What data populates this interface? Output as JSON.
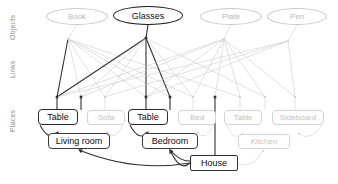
{
  "diagram": {
    "tiers": [
      {
        "id": "objects",
        "label": "Objects"
      },
      {
        "id": "links",
        "label": "Links"
      },
      {
        "id": "places",
        "label": "Places"
      }
    ],
    "objects": [
      {
        "id": "book",
        "label": "Book",
        "x": 46,
        "y": 8,
        "w": 62,
        "emphasis": "faded"
      },
      {
        "id": "glasses",
        "label": "Glasses",
        "x": 113,
        "y": 6,
        "w": 70,
        "emphasis": "strong"
      },
      {
        "id": "plate",
        "label": "Plate",
        "x": 200,
        "y": 8,
        "w": 62,
        "emphasis": "faded"
      },
      {
        "id": "pen",
        "label": "Pen",
        "x": 267,
        "y": 8,
        "w": 60,
        "emphasis": "faded"
      }
    ],
    "places": [
      {
        "id": "table-living",
        "label": "Table",
        "x": 38,
        "y": 109,
        "w": 40,
        "emphasis": "strong"
      },
      {
        "id": "sofa",
        "label": "Sofa",
        "x": 87,
        "y": 110,
        "w": 38,
        "emphasis": "faded"
      },
      {
        "id": "table-bedroom",
        "label": "Table",
        "x": 128,
        "y": 109,
        "w": 40,
        "emphasis": "strong"
      },
      {
        "id": "bed",
        "label": "Bed",
        "x": 178,
        "y": 110,
        "w": 38,
        "emphasis": "faded"
      },
      {
        "id": "table-kitchen",
        "label": "Table",
        "x": 224,
        "y": 110,
        "w": 38,
        "emphasis": "faded"
      },
      {
        "id": "sideboard",
        "label": "Sideboard",
        "x": 272,
        "y": 110,
        "w": 52,
        "emphasis": "faded"
      }
    ],
    "rooms": [
      {
        "id": "living-room",
        "label": "Living room",
        "x": 48,
        "y": 133,
        "w": 62,
        "emphasis": "strong"
      },
      {
        "id": "bedroom",
        "label": "Bedroom",
        "x": 142,
        "y": 133,
        "w": 56,
        "emphasis": "strong"
      },
      {
        "id": "kitchen",
        "label": "Kitchen",
        "x": 238,
        "y": 134,
        "w": 52,
        "emphasis": "faded"
      }
    ],
    "root": {
      "id": "house",
      "label": "House",
      "x": 190,
      "y": 155,
      "w": 48,
      "emphasis": "strong"
    },
    "link_hubs": [
      {
        "id": "hub-book",
        "x": 68,
        "y": 39,
        "emphasis": "faded"
      },
      {
        "id": "hub-glasses",
        "x": 146,
        "y": 38,
        "emphasis": "strong"
      },
      {
        "id": "hub-plate",
        "x": 224,
        "y": 39,
        "emphasis": "faded"
      },
      {
        "id": "hub-pen",
        "x": 288,
        "y": 41,
        "emphasis": "faded"
      }
    ],
    "place_anchors": [
      {
        "id": "anchor-table-living",
        "x": 57,
        "y": 97,
        "emphasis": "strong"
      },
      {
        "id": "anchor-sofa",
        "x": 81,
        "y": 97,
        "emphasis": "strong"
      },
      {
        "id": "anchor-sofa-2",
        "x": 105,
        "y": 97,
        "emphasis": "faded"
      },
      {
        "id": "anchor-table-bedroom",
        "x": 146,
        "y": 97,
        "emphasis": "strong"
      },
      {
        "id": "anchor-bed",
        "x": 170,
        "y": 97,
        "emphasis": "strong"
      },
      {
        "id": "anchor-bed-2",
        "x": 193,
        "y": 97,
        "emphasis": "faded"
      },
      {
        "id": "anchor-house-stem",
        "x": 215,
        "y": 97,
        "emphasis": "strong"
      },
      {
        "id": "anchor-table-kitchen",
        "x": 240,
        "y": 97,
        "emphasis": "faded"
      },
      {
        "id": "anchor-sideboard",
        "x": 265,
        "y": 97,
        "emphasis": "faded"
      },
      {
        "id": "anchor-sideboard-2",
        "x": 295,
        "y": 97,
        "emphasis": "faded"
      }
    ],
    "edges": {
      "object_to_hub": [
        {
          "from": "book",
          "to": "hub-book",
          "emphasis": "faded"
        },
        {
          "from": "glasses",
          "to": "hub-glasses",
          "emphasis": "strong"
        },
        {
          "from": "plate",
          "to": "hub-plate",
          "emphasis": "faded"
        },
        {
          "from": "pen",
          "to": "hub-pen",
          "emphasis": "faded"
        }
      ],
      "hub_to_anchor": [
        {
          "from": "hub-book",
          "to": "anchor-table-living",
          "emphasis": "strong"
        },
        {
          "from": "hub-book",
          "to": "anchor-sofa",
          "emphasis": "faded"
        },
        {
          "from": "hub-book",
          "to": "anchor-sofa-2",
          "emphasis": "faded"
        },
        {
          "from": "hub-book",
          "to": "anchor-table-bedroom",
          "emphasis": "faded"
        },
        {
          "from": "hub-book",
          "to": "anchor-bed",
          "emphasis": "faded"
        },
        {
          "from": "hub-book",
          "to": "anchor-bed-2",
          "emphasis": "faded"
        },
        {
          "from": "hub-book",
          "to": "anchor-table-kitchen",
          "emphasis": "faded"
        },
        {
          "from": "hub-glasses",
          "to": "anchor-table-living",
          "emphasis": "strong"
        },
        {
          "from": "hub-glasses",
          "to": "anchor-table-bedroom",
          "emphasis": "strong"
        },
        {
          "from": "hub-glasses",
          "to": "anchor-bed",
          "emphasis": "strong"
        },
        {
          "from": "hub-glasses",
          "to": "anchor-sofa",
          "emphasis": "faded"
        },
        {
          "from": "hub-glasses",
          "to": "anchor-sofa-2",
          "emphasis": "faded"
        },
        {
          "from": "hub-glasses",
          "to": "anchor-bed-2",
          "emphasis": "faded"
        },
        {
          "from": "hub-glasses",
          "to": "anchor-sideboard",
          "emphasis": "faded"
        },
        {
          "from": "hub-plate",
          "to": "anchor-table-living",
          "emphasis": "faded"
        },
        {
          "from": "hub-plate",
          "to": "anchor-sofa",
          "emphasis": "faded"
        },
        {
          "from": "hub-plate",
          "to": "anchor-table-bedroom",
          "emphasis": "faded"
        },
        {
          "from": "hub-plate",
          "to": "anchor-bed-2",
          "emphasis": "faded"
        },
        {
          "from": "hub-plate",
          "to": "anchor-house-stem",
          "emphasis": "faded"
        },
        {
          "from": "hub-plate",
          "to": "anchor-table-kitchen",
          "emphasis": "faded"
        },
        {
          "from": "hub-plate",
          "to": "anchor-sideboard",
          "emphasis": "faded"
        },
        {
          "from": "hub-plate",
          "to": "anchor-sideboard-2",
          "emphasis": "faded"
        },
        {
          "from": "hub-pen",
          "to": "anchor-table-living",
          "emphasis": "faded"
        },
        {
          "from": "hub-pen",
          "to": "anchor-sofa-2",
          "emphasis": "faded"
        },
        {
          "from": "hub-pen",
          "to": "anchor-table-bedroom",
          "emphasis": "faded"
        },
        {
          "from": "hub-pen",
          "to": "anchor-sideboard-2",
          "emphasis": "faded"
        }
      ],
      "anchor_to_place": [
        {
          "from": "anchor-table-living",
          "to": "table-living",
          "emphasis": "strong"
        },
        {
          "from": "anchor-sofa",
          "to": "sofa",
          "emphasis": "strong"
        },
        {
          "from": "anchor-sofa-2",
          "to": "sofa",
          "emphasis": "faded"
        },
        {
          "from": "anchor-table-bedroom",
          "to": "table-bedroom",
          "emphasis": "strong"
        },
        {
          "from": "anchor-bed",
          "to": "bed",
          "emphasis": "strong"
        },
        {
          "from": "anchor-bed-2",
          "to": "bed",
          "emphasis": "faded"
        },
        {
          "from": "anchor-table-kitchen",
          "to": "table-kitchen",
          "emphasis": "faded"
        },
        {
          "from": "anchor-sideboard",
          "to": "sideboard",
          "emphasis": "faded"
        },
        {
          "from": "anchor-sideboard-2",
          "to": "sideboard",
          "emphasis": "faded"
        }
      ],
      "place_to_room": [
        {
          "from": "table-living",
          "to": "living-room",
          "emphasis": "strong"
        },
        {
          "from": "sofa",
          "to": "living-room",
          "emphasis": "faded"
        },
        {
          "from": "table-bedroom",
          "to": "bedroom",
          "emphasis": "strong"
        },
        {
          "from": "bed",
          "to": "bedroom",
          "emphasis": "faded"
        },
        {
          "from": "table-kitchen",
          "to": "kitchen",
          "emphasis": "faded"
        },
        {
          "from": "sideboard",
          "to": "kitchen",
          "emphasis": "faded"
        }
      ],
      "room_to_root": [
        {
          "from": "house",
          "to": "living-room",
          "emphasis": "strong"
        },
        {
          "from": "house",
          "to": "bedroom",
          "emphasis": "strong"
        },
        {
          "from": "house",
          "to": "kitchen",
          "emphasis": "faded"
        }
      ]
    },
    "colors": {
      "strong_stroke": "#303030",
      "faded_stroke": "#d0d0d0",
      "mid_stroke": "#9a9a9a",
      "background": "#ffffff",
      "strong_text": "#0d0d0d",
      "faded_text": "#c0c0c0",
      "tier_label_text": "#8a8a8a"
    }
  }
}
